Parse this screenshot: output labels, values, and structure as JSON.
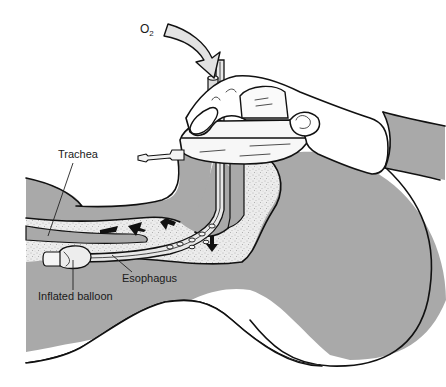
{
  "figure": {
    "labels": {
      "oxygen": "O",
      "oxygen_subscript": "2",
      "trachea": "Trachea",
      "esophagus": "Esophagus",
      "inflated_balloon": "Inflated balloon"
    },
    "colors": {
      "tissue": "#a9a9a9",
      "airway_speckle": "#ebebeb",
      "outline": "#111111",
      "background": "#ffffff",
      "o2_arrow_fill": "#e2e2e2"
    },
    "icons": {
      "oxygen_flow": "curved-arrow-down",
      "airflow": "small-black-arrows"
    }
  }
}
